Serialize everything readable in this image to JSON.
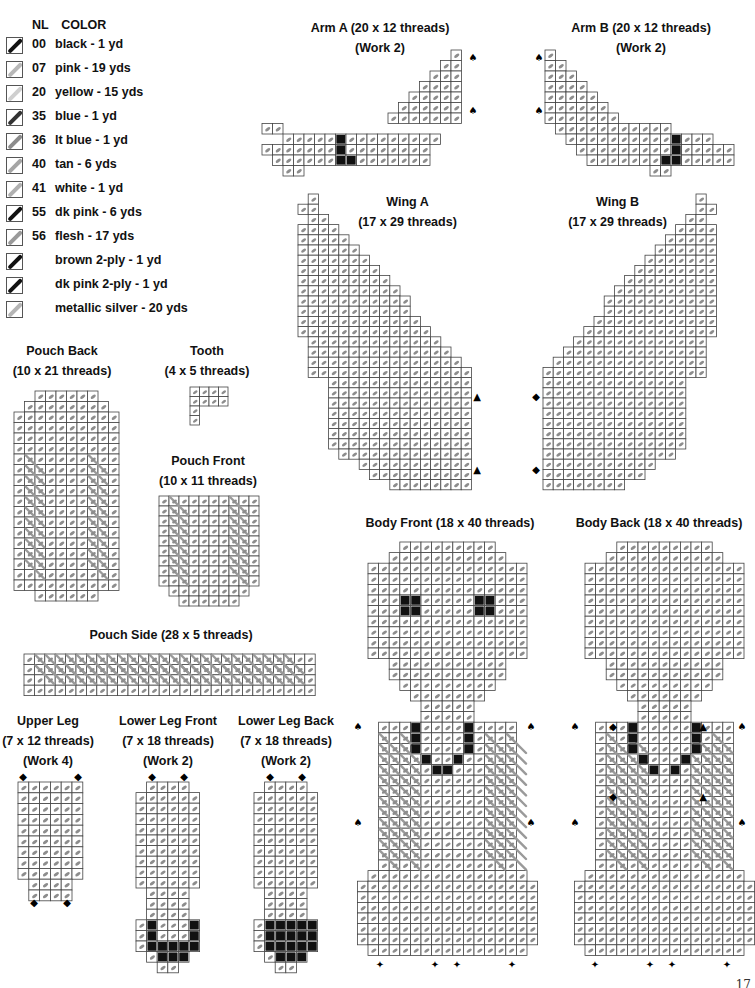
{
  "legend": {
    "header": {
      "nl": "NL",
      "color": "COLOR"
    },
    "items": [
      {
        "nl": "00",
        "color": "black - 1 yd",
        "swatch": "#111111"
      },
      {
        "nl": "07",
        "color": "pink - 19 yds",
        "swatch": "#b8b8b8"
      },
      {
        "nl": "20",
        "color": "yellow - 15 yds",
        "swatch": "#cfcfcf"
      },
      {
        "nl": "35",
        "color": "blue - 1 yd",
        "swatch": "#333333"
      },
      {
        "nl": "36",
        "color": "lt blue - 1 yd",
        "swatch": "#8c8c8c"
      },
      {
        "nl": "40",
        "color": "tan - 6 yds",
        "swatch": "#a5a5a5"
      },
      {
        "nl": "41",
        "color": "white - 1 yd",
        "swatch": "#b0b0b0"
      },
      {
        "nl": "55",
        "color": "dk pink - 6 yds",
        "swatch": "#111111"
      },
      {
        "nl": "56",
        "color": "flesh - 17 yds",
        "swatch": "#9a9a9a"
      },
      {
        "nl": "",
        "color": "brown 2-ply - 1 yd",
        "swatch": "#111111"
      },
      {
        "nl": "",
        "color": "dk pink 2-ply - 1 yd",
        "swatch": "#111111"
      },
      {
        "nl": "",
        "color": "metallic silver - 20 yds",
        "swatch": "#b5b5b5"
      }
    ]
  },
  "pieces": {
    "arm_a": {
      "title": "Arm A (20 x 12 threads)",
      "note": "(Work 2)"
    },
    "arm_b": {
      "title": "Arm B (20 x 12 threads)",
      "note": "(Work 2)"
    },
    "wing_a": {
      "title": "Wing A",
      "size": "(17 x 29 threads)"
    },
    "wing_b": {
      "title": "Wing B",
      "size": "(17 x 29 threads)"
    },
    "pouch_back": {
      "title": "Pouch Back",
      "size": "(10 x 21 threads)"
    },
    "tooth": {
      "title": "Tooth",
      "size": "(4 x 5 threads)"
    },
    "pouch_front": {
      "title": "Pouch Front",
      "size": "(10 x 11 threads)"
    },
    "pouch_side": {
      "title": "Pouch Side (28 x 5 threads)"
    },
    "body_front": {
      "title": "Body Front (18 x 40 threads)"
    },
    "body_back": {
      "title": "Body Back (18 x 40 threads)"
    },
    "upper_leg": {
      "title": "Upper Leg",
      "size": "(7 x 12 threads)",
      "note": "(Work 4)"
    },
    "lower_leg_front": {
      "title": "Lower Leg Front",
      "size": "(7 x 18 threads)",
      "note": "(Work 2)"
    },
    "lower_leg_back": {
      "title": "Lower Leg Back",
      "size": "(7 x 18 threads)",
      "note": "(Work 2)"
    }
  },
  "page_number": "17"
}
